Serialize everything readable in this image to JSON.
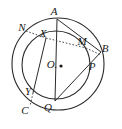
{
  "figure": {
    "kind": "geometry-diagram",
    "stroke_color": "#2b2b2b",
    "dotted_color": "#4a4a4a",
    "background_color": "#ffffff",
    "canvas": {
      "width": 122,
      "height": 129
    }
  },
  "shapes": {
    "outer_circle": {
      "name": "outer-circle",
      "cx": 58,
      "cy": 64,
      "r": 46
    },
    "inner_circle": {
      "name": "inner-circle",
      "cx": 56,
      "cy": 65,
      "r": 34
    }
  },
  "center_point": {
    "name": "O",
    "label": "O.",
    "x": 52,
    "y": 64,
    "dot_x": 61,
    "dot_y": 66
  },
  "points": [
    {
      "name": "A",
      "label": "A",
      "lx": 54,
      "ly": 11,
      "px": 57,
      "py": 19
    },
    {
      "name": "N",
      "label": "N",
      "lx": 22,
      "ly": 27,
      "px": 30,
      "py": 33
    },
    {
      "name": "X",
      "label": "X",
      "lx": 43,
      "ly": 33,
      "px": 46,
      "py": 38
    },
    {
      "name": "M",
      "label": "M",
      "lx": 82,
      "ly": 41,
      "px": 84,
      "py": 47
    },
    {
      "name": "B",
      "label": "B",
      "lx": 105,
      "ly": 48,
      "px": 99,
      "py": 53
    },
    {
      "name": "P",
      "label": "P",
      "lx": 92,
      "ly": 66,
      "px": 88,
      "py": 68
    },
    {
      "name": "Y",
      "label": "Y",
      "lx": 28,
      "ly": 91,
      "px": 33,
      "py": 93
    },
    {
      "name": "C",
      "label": "C",
      "lx": 25,
      "ly": 110,
      "px": 33,
      "py": 103
    },
    {
      "name": "Q",
      "label": "Q",
      "lx": 48,
      "ly": 107,
      "px": 55,
      "py": 99
    }
  ],
  "solid_segments": [
    {
      "name": "segment-A-B",
      "from": "A",
      "to": "B",
      "x1": 57,
      "y1": 19,
      "x2": 101,
      "y2": 52
    },
    {
      "name": "segment-A-Q",
      "from": "A",
      "to": "Q",
      "x1": 57,
      "y1": 19,
      "x2": 55,
      "y2": 101
    },
    {
      "name": "segment-B-Q",
      "from": "B",
      "to": "Q",
      "x1": 101,
      "y1": 52,
      "x2": 55,
      "y2": 101
    },
    {
      "name": "segment-X-Y",
      "from": "X",
      "to": "Y",
      "x1": 46,
      "y1": 38,
      "x2": 33,
      "y2": 93
    }
  ],
  "dotted_segments": [
    {
      "name": "segment-N-X",
      "from": "N",
      "to": "X",
      "x1": 26,
      "y1": 31,
      "x2": 46,
      "y2": 38
    },
    {
      "name": "segment-X-M",
      "from": "X",
      "to": "M",
      "x1": 46,
      "y1": 38,
      "x2": 86,
      "y2": 48
    },
    {
      "name": "segment-M-B",
      "from": "M",
      "to": "B",
      "x1": 86,
      "y1": 48,
      "x2": 101,
      "y2": 55
    },
    {
      "name": "segment-Y-C",
      "from": "Y",
      "to": "C",
      "x1": 33,
      "y1": 93,
      "x2": 30,
      "y2": 106
    }
  ]
}
